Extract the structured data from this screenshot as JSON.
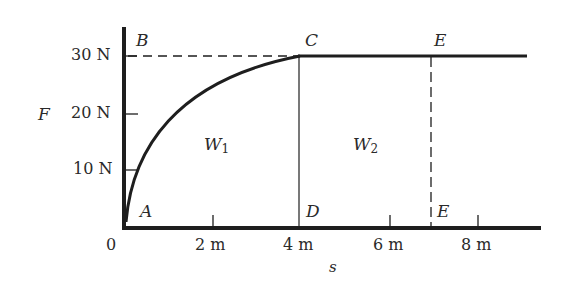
{
  "diagram": {
    "type": "work-diagram",
    "axes": {
      "y_name": "F",
      "x_name": "s",
      "y_ticks": [
        "10 N",
        "20 N",
        "30 N"
      ],
      "x_ticks": [
        "0",
        "2 m",
        "4 m",
        "6 m",
        "8 m"
      ]
    },
    "points": {
      "A": "A",
      "B": "B",
      "C": "C",
      "D": "D",
      "E_top": "E",
      "E_bottom": "E"
    },
    "regions": {
      "w1_base": "W",
      "w1_sub": "1",
      "w2_base": "W",
      "w2_sub": "2"
    },
    "colors": {
      "line": "#1e1e1e",
      "text": "#2a2a2a",
      "background": "#ffffff"
    }
  }
}
